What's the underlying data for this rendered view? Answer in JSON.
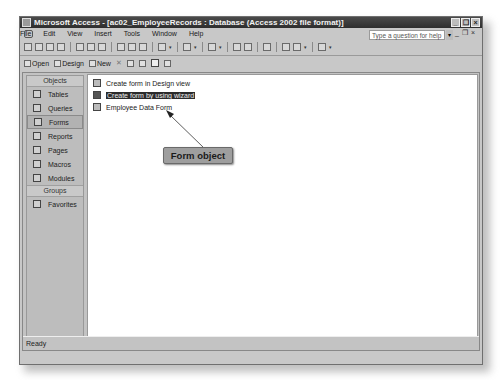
{
  "window": {
    "title": "Microsoft Access - [ac02_EmployeeRecords : Database (Access 2002 file format)]",
    "buttons": [
      "minimize",
      "restore",
      "close"
    ]
  },
  "menubar": {
    "items": [
      "File",
      "Edit",
      "View",
      "Insert",
      "Tools",
      "Window",
      "Help"
    ],
    "help_placeholder": "Type a question for help"
  },
  "toolbar": {
    "icons": [
      "new-icon",
      "open-icon",
      "save-icon",
      "file-search-icon",
      "print-icon",
      "print-preview-icon",
      "spelling-icon",
      "cut-icon",
      "copy-icon",
      "paste-icon",
      "undo-icon",
      "office-links-icon",
      "analyze-icon",
      "code-icon",
      "script-icon",
      "properties-icon",
      "relationships-icon",
      "new-object-icon",
      "help-icon"
    ]
  },
  "db_toolbar": {
    "open": "Open",
    "design": "Design",
    "new": "New"
  },
  "objects_bar": {
    "objects_header": "Objects",
    "items": [
      {
        "label": "Tables",
        "selected": false
      },
      {
        "label": "Queries",
        "selected": false
      },
      {
        "label": "Forms",
        "selected": true
      },
      {
        "label": "Reports",
        "selected": false
      },
      {
        "label": "Pages",
        "selected": false
      },
      {
        "label": "Macros",
        "selected": false
      },
      {
        "label": "Modules",
        "selected": false
      }
    ],
    "groups_header": "Groups",
    "groups": [
      {
        "label": "Favorites"
      }
    ]
  },
  "list": {
    "items": [
      {
        "label": "Create form in Design view",
        "selected": false
      },
      {
        "label": "Create form by using wizard",
        "selected": true
      },
      {
        "label": "Employee Data Form",
        "selected": false
      }
    ]
  },
  "callout": {
    "label": "Form object"
  },
  "status": {
    "text": "Ready"
  }
}
